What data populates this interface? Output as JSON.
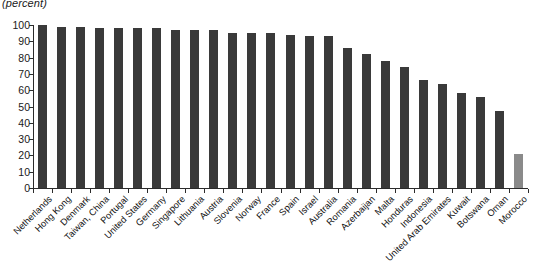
{
  "chart_data": {
    "type": "bar",
    "title": "(percent)",
    "xlabel": "",
    "ylabel": "",
    "ylim": [
      0,
      100
    ],
    "yticks": [
      0,
      10,
      20,
      30,
      40,
      50,
      60,
      70,
      80,
      90,
      100
    ],
    "grid": false,
    "legend": "none",
    "bar_color": "#3a3a3a",
    "highlight_color": "#8a8a8a",
    "highlight_category": "Morocco",
    "categories": [
      "Netherlands",
      "Hong Kong",
      "Denmark",
      "Taiwan, China",
      "Portugal",
      "United States",
      "Germany",
      "Singapore",
      "Lithuania",
      "Austria",
      "Slovenia",
      "Norway",
      "France",
      "Spain",
      "Israel",
      "Australia",
      "Romania",
      "Azerbaijan",
      "Malta",
      "Honduras",
      "Indonesia",
      "United Arab Emirates",
      "Kuwait",
      "Botswana",
      "Oman",
      "Morocco"
    ],
    "values": [
      100,
      99,
      99,
      98,
      98,
      98,
      98,
      97,
      97,
      97,
      95,
      95,
      95,
      94,
      93,
      93,
      86,
      82,
      78,
      74,
      66,
      64,
      58,
      56,
      47,
      21
    ]
  }
}
